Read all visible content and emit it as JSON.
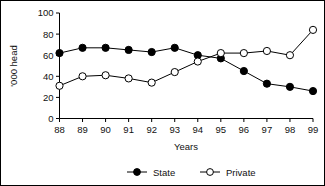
{
  "chart_data": {
    "type": "line",
    "title": "",
    "xlabel": "Years",
    "ylabel": "'000 head",
    "categories": [
      "88",
      "89",
      "90",
      "91",
      "92",
      "93",
      "94",
      "95",
      "96",
      "97",
      "98",
      "99"
    ],
    "x": [
      88,
      89,
      90,
      91,
      92,
      93,
      94,
      95,
      96,
      97,
      98,
      99
    ],
    "series": [
      {
        "name": "State",
        "marker": "filled-circle",
        "color": "#000000",
        "values": [
          62,
          67,
          67,
          65,
          63,
          67,
          60,
          57,
          45,
          33,
          30,
          26
        ]
      },
      {
        "name": "Private",
        "marker": "open-circle",
        "color": "#000000",
        "values": [
          31,
          40,
          41,
          38,
          34,
          44,
          54,
          62,
          62,
          64,
          60,
          84
        ]
      }
    ],
    "ylim": [
      0,
      100
    ],
    "yticks": [
      0,
      20,
      40,
      60,
      80,
      100
    ],
    "ytick_labels": [
      "0",
      "20",
      "40",
      "60",
      "80",
      "100"
    ],
    "xtick_labels": [
      "88",
      "89",
      "90",
      "91",
      "92",
      "93",
      "94",
      "95",
      "96",
      "97",
      "98",
      "99"
    ],
    "grid": false,
    "legend_position": "bottom"
  },
  "legend": {
    "entries": [
      {
        "label": "State"
      },
      {
        "label": "Private"
      }
    ]
  },
  "axes": {
    "x_title": "Years",
    "y_title": "'000 head"
  },
  "border": {
    "color": "#000000"
  }
}
